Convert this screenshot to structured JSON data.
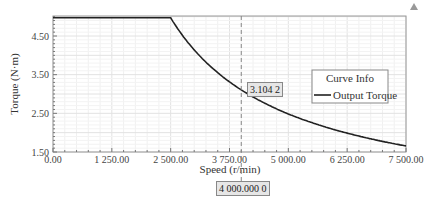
{
  "chart_data": {
    "type": "line",
    "title": "",
    "xlabel": "Speed (r/min)",
    "ylabel": "Torque (N·m)",
    "xlim": [
      0,
      7500
    ],
    "ylim": [
      1.5,
      5.0
    ],
    "x_ticks": [
      "0.00",
      "1 250.00",
      "2 500.00",
      "3 750.00",
      "5 000.00",
      "6 250.00",
      "7 500.00"
    ],
    "y_ticks": [
      "1.50",
      "2.50",
      "3.50",
      "4.50"
    ],
    "grid": true,
    "legend": {
      "title": "Curve Info",
      "position": "right-middle",
      "entries": [
        "Output Torque"
      ]
    },
    "series": [
      {
        "name": "Output Torque",
        "color": "#222222",
        "x": [
          0,
          500,
          1000,
          1500,
          2000,
          2500,
          2750,
          3000,
          3250,
          3500,
          3750,
          4000,
          4500,
          5000,
          5500,
          6000,
          6500,
          7000,
          7500
        ],
        "values": [
          4.97,
          4.97,
          4.97,
          4.97,
          4.97,
          4.97,
          4.52,
          4.14,
          3.82,
          3.55,
          3.31,
          3.1,
          2.76,
          2.48,
          2.26,
          2.07,
          1.91,
          1.77,
          1.66
        ]
      }
    ],
    "annotations": {
      "cursor_x": 4000,
      "cursor_x_label": "4 000.000 0",
      "cursor_y_label": "3.104 2"
    }
  },
  "controls": {
    "collapse_icon": "triangle-up-icon"
  }
}
